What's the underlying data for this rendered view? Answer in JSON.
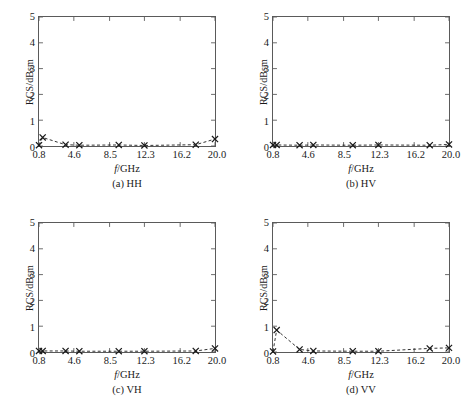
{
  "figure": {
    "axis_color": "#5a5a5a",
    "series_color": "#1a1a1a",
    "background": "#ffffff"
  },
  "chart_data": [
    {
      "type": "line",
      "title": "(a) HH",
      "xlabel": "f/GHz",
      "ylabel": "RCS/dBsm",
      "xlim": [
        0.8,
        20.0
      ],
      "ylim": [
        0,
        5
      ],
      "xticks": [
        0.8,
        4.6,
        8.5,
        12.3,
        16.2,
        20.0
      ],
      "xtick_labels": [
        "0.8",
        "4.6",
        "8.5",
        "12.3",
        "16.2",
        "20.0"
      ],
      "yticks": [
        0,
        1,
        2,
        3,
        4,
        5
      ],
      "ytick_labels": [
        "0",
        "1",
        "2",
        "3",
        "4",
        "5"
      ],
      "grid": false,
      "legend": null,
      "marker": "x",
      "linestyle": "dashed",
      "x": [
        0.8,
        1.2,
        3.7,
        5.2,
        9.5,
        12.3,
        17.9,
        20.0
      ],
      "values": [
        0.03,
        0.33,
        0.05,
        0.03,
        0.04,
        0.02,
        0.05,
        0.27
      ]
    },
    {
      "type": "line",
      "title": "(b) HV",
      "xlabel": "f/GHz",
      "ylabel": "RCS/dBsm",
      "xlim": [
        0.8,
        20.0
      ],
      "ylim": [
        0,
        5
      ],
      "xticks": [
        0.8,
        4.6,
        8.5,
        12.3,
        16.2,
        20.0
      ],
      "xtick_labels": [
        "0.8",
        "4.6",
        "8.5",
        "12.3",
        "16.2",
        "20.0"
      ],
      "yticks": [
        0,
        1,
        2,
        3,
        4,
        5
      ],
      "ytick_labels": [
        "0",
        "1",
        "2",
        "3",
        "4",
        "5"
      ],
      "grid": false,
      "legend": null,
      "marker": "x",
      "linestyle": "dashed",
      "x": [
        0.8,
        1.2,
        3.7,
        5.2,
        9.5,
        12.3,
        17.9,
        20.0
      ],
      "values": [
        0.04,
        0.04,
        0.03,
        0.04,
        0.03,
        0.04,
        0.03,
        0.06
      ]
    },
    {
      "type": "line",
      "title": "(c) VH",
      "xlabel": "f/GHz",
      "ylabel": "RCS/dBsm",
      "xlim": [
        0.8,
        20.0
      ],
      "ylim": [
        0,
        5
      ],
      "xticks": [
        0.8,
        4.6,
        8.5,
        12.3,
        16.2,
        20.0
      ],
      "xtick_labels": [
        "0.8",
        "4.6",
        "8.5",
        "12.3",
        "16.2",
        "20.0"
      ],
      "yticks": [
        0,
        1,
        2,
        3,
        4,
        5
      ],
      "ytick_labels": [
        "0",
        "1",
        "2",
        "3",
        "4",
        "5"
      ],
      "grid": false,
      "legend": null,
      "marker": "x",
      "linestyle": "dashed",
      "x": [
        0.8,
        1.2,
        3.7,
        5.2,
        9.5,
        12.3,
        17.9,
        20.0
      ],
      "values": [
        0.04,
        0.04,
        0.04,
        0.03,
        0.03,
        0.03,
        0.04,
        0.14
      ]
    },
    {
      "type": "line",
      "title": "(d) VV",
      "xlabel": "f/GHz",
      "ylabel": "RCS/dBsm",
      "xlim": [
        0.8,
        20.0
      ],
      "ylim": [
        0,
        5
      ],
      "xticks": [
        0.8,
        4.6,
        8.5,
        12.3,
        16.2,
        20.0
      ],
      "xtick_labels": [
        "0.8",
        "4.6",
        "8.5",
        "12.3",
        "16.2",
        "20.0"
      ],
      "yticks": [
        0,
        1,
        2,
        3,
        4,
        5
      ],
      "ytick_labels": [
        "0",
        "1",
        "2",
        "3",
        "4",
        "5"
      ],
      "grid": false,
      "legend": null,
      "marker": "x",
      "linestyle": "dashed",
      "x": [
        0.8,
        1.2,
        3.7,
        5.2,
        9.5,
        12.3,
        17.9,
        20.0
      ],
      "values": [
        0.02,
        0.85,
        0.1,
        0.04,
        0.03,
        0.03,
        0.14,
        0.16
      ]
    }
  ]
}
